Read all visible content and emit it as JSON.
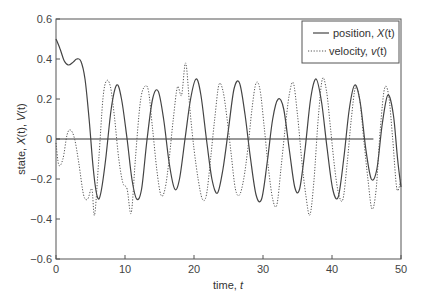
{
  "chart_data": {
    "type": "line",
    "title": "",
    "xlabel": "time, t",
    "ylabel": "state, X(t), V(t)",
    "xlim": [
      0,
      50
    ],
    "ylim": [
      -0.6,
      0.6
    ],
    "xticks": [
      0,
      10,
      20,
      30,
      40,
      50
    ],
    "yticks": [
      -0.6,
      -0.4,
      -0.2,
      0,
      0.2,
      0.4,
      0.6
    ],
    "xtick_labels": [
      "0",
      "10",
      "20",
      "30",
      "40",
      "50"
    ],
    "ytick_labels": [
      "−0.6",
      "−0.4",
      "−0.2",
      "0",
      "0.2",
      "0.4",
      "0.6"
    ],
    "grid": false,
    "legend_position": "upper right",
    "reference_line": {
      "y": 0,
      "x_from": 0,
      "x_to": 46
    },
    "series": [
      {
        "name": "position, X(t)",
        "style": "solid",
        "color": "#444444",
        "points": [
          [
            0,
            0.5
          ],
          [
            0.6,
            0.45
          ],
          [
            1.2,
            0.39
          ],
          [
            1.8,
            0.37
          ],
          [
            2.5,
            0.385
          ],
          [
            3.0,
            0.4
          ],
          [
            3.6,
            0.39
          ],
          [
            4.2,
            0.3
          ],
          [
            4.8,
            0.1
          ],
          [
            5.4,
            -0.15
          ],
          [
            6.0,
            -0.29
          ],
          [
            6.5,
            -0.27
          ],
          [
            7.2,
            -0.1
          ],
          [
            8.0,
            0.15
          ],
          [
            8.8,
            0.27
          ],
          [
            9.5,
            0.2
          ],
          [
            10.3,
            0.0
          ],
          [
            11.0,
            -0.2
          ],
          [
            11.7,
            -0.3
          ],
          [
            12.4,
            -0.25
          ],
          [
            13.2,
            0.0
          ],
          [
            14.0,
            0.2
          ],
          [
            14.8,
            0.24
          ],
          [
            15.6,
            0.1
          ],
          [
            16.4,
            -0.12
          ],
          [
            17.2,
            -0.25
          ],
          [
            17.9,
            -0.2
          ],
          [
            18.7,
            0.0
          ],
          [
            19.5,
            0.2
          ],
          [
            20.3,
            0.3
          ],
          [
            21.0,
            0.22
          ],
          [
            21.8,
            0.0
          ],
          [
            22.6,
            -0.2
          ],
          [
            23.4,
            -0.27
          ],
          [
            24.2,
            -0.15
          ],
          [
            25.0,
            0.05
          ],
          [
            25.8,
            0.25
          ],
          [
            26.6,
            0.28
          ],
          [
            27.4,
            0.12
          ],
          [
            28.2,
            -0.1
          ],
          [
            29.0,
            -0.28
          ],
          [
            29.8,
            -0.3
          ],
          [
            30.6,
            -0.12
          ],
          [
            31.4,
            0.1
          ],
          [
            32.2,
            0.2
          ],
          [
            33.0,
            0.15
          ],
          [
            33.8,
            -0.05
          ],
          [
            34.6,
            -0.24
          ],
          [
            35.3,
            -0.25
          ],
          [
            36.1,
            -0.05
          ],
          [
            36.9,
            0.2
          ],
          [
            37.7,
            0.3
          ],
          [
            38.5,
            0.18
          ],
          [
            39.3,
            -0.05
          ],
          [
            40.1,
            -0.25
          ],
          [
            40.9,
            -0.29
          ],
          [
            41.7,
            -0.1
          ],
          [
            42.5,
            0.15
          ],
          [
            43.3,
            0.27
          ],
          [
            44.1,
            0.18
          ],
          [
            44.9,
            -0.05
          ],
          [
            45.7,
            -0.2
          ],
          [
            46.5,
            -0.15
          ],
          [
            47.3,
            0.08
          ],
          [
            48.1,
            0.22
          ],
          [
            48.9,
            0.12
          ],
          [
            49.5,
            -0.1
          ],
          [
            50,
            -0.24
          ]
        ]
      },
      {
        "name": "velocity, v(t)",
        "style": "dotted",
        "color": "#555555",
        "points": [
          [
            0,
            -0.02
          ],
          [
            0.4,
            -0.13
          ],
          [
            1.0,
            -0.1
          ],
          [
            1.6,
            0.02
          ],
          [
            2.1,
            0.045
          ],
          [
            2.7,
            0.0
          ],
          [
            3.3,
            -0.12
          ],
          [
            4.0,
            -0.28
          ],
          [
            4.6,
            -0.3
          ],
          [
            5.2,
            -0.25
          ],
          [
            5.6,
            -0.38
          ],
          [
            6.2,
            -0.1
          ],
          [
            6.8,
            0.2
          ],
          [
            7.3,
            0.29
          ],
          [
            7.9,
            0.26
          ],
          [
            8.5,
            0.1
          ],
          [
            9.1,
            -0.1
          ],
          [
            9.7,
            -0.22
          ],
          [
            10.3,
            -0.25
          ],
          [
            10.9,
            -0.37
          ],
          [
            11.5,
            -0.1
          ],
          [
            12.2,
            0.18
          ],
          [
            12.8,
            0.26
          ],
          [
            13.4,
            0.24
          ],
          [
            14.0,
            0.05
          ],
          [
            14.6,
            -0.15
          ],
          [
            15.2,
            -0.28
          ],
          [
            15.8,
            -0.25
          ],
          [
            16.4,
            -0.1
          ],
          [
            17.0,
            0.1
          ],
          [
            17.6,
            0.26
          ],
          [
            18.2,
            0.22
          ],
          [
            18.8,
            0.38
          ],
          [
            19.4,
            0.15
          ],
          [
            20.0,
            -0.05
          ],
          [
            20.6,
            -0.2
          ],
          [
            21.2,
            -0.3
          ],
          [
            21.8,
            -0.28
          ],
          [
            22.4,
            -0.1
          ],
          [
            23.0,
            0.1
          ],
          [
            23.6,
            0.27
          ],
          [
            24.2,
            0.24
          ],
          [
            24.8,
            0.1
          ],
          [
            25.4,
            -0.08
          ],
          [
            26.0,
            -0.25
          ],
          [
            26.6,
            -0.28
          ],
          [
            27.2,
            -0.2
          ],
          [
            27.8,
            -0.05
          ],
          [
            28.4,
            0.15
          ],
          [
            29.0,
            0.28
          ],
          [
            29.6,
            0.24
          ],
          [
            30.2,
            0.05
          ],
          [
            30.8,
            -0.15
          ],
          [
            31.4,
            -0.3
          ],
          [
            32.0,
            -0.33
          ],
          [
            32.6,
            -0.15
          ],
          [
            33.2,
            0.05
          ],
          [
            33.8,
            0.22
          ],
          [
            34.4,
            0.28
          ],
          [
            35.0,
            0.12
          ],
          [
            35.6,
            -0.1
          ],
          [
            36.2,
            -0.28
          ],
          [
            36.8,
            -0.38
          ],
          [
            37.4,
            -0.2
          ],
          [
            38.0,
            0.1
          ],
          [
            38.6,
            0.3
          ],
          [
            39.2,
            0.24
          ],
          [
            39.8,
            0.05
          ],
          [
            40.4,
            -0.15
          ],
          [
            41.0,
            -0.28
          ],
          [
            41.6,
            -0.3
          ],
          [
            42.2,
            -0.12
          ],
          [
            42.8,
            0.1
          ],
          [
            43.4,
            0.26
          ],
          [
            44.0,
            0.2
          ],
          [
            44.6,
            0.0
          ],
          [
            45.2,
            -0.2
          ],
          [
            45.8,
            -0.35
          ],
          [
            46.4,
            -0.25
          ],
          [
            47.0,
            0.05
          ],
          [
            47.6,
            0.25
          ],
          [
            48.2,
            0.22
          ],
          [
            48.8,
            0.0
          ],
          [
            49.4,
            -0.25
          ],
          [
            50,
            -0.2
          ]
        ]
      }
    ]
  },
  "legend": {
    "items": [
      {
        "label_prefix": "position, ",
        "label_var": "X",
        "label_suffix": "(t)"
      },
      {
        "label_prefix": "velocity, ",
        "label_var": "v",
        "label_suffix": "(t)"
      }
    ]
  },
  "axes": {
    "xlabel_prefix": "time, ",
    "xlabel_var": "t",
    "ylabel_prefix": "state, ",
    "ylabel_var1": "X",
    "ylabel_mid": "(t), ",
    "ylabel_var2": "V",
    "ylabel_suffix": "(t)"
  }
}
